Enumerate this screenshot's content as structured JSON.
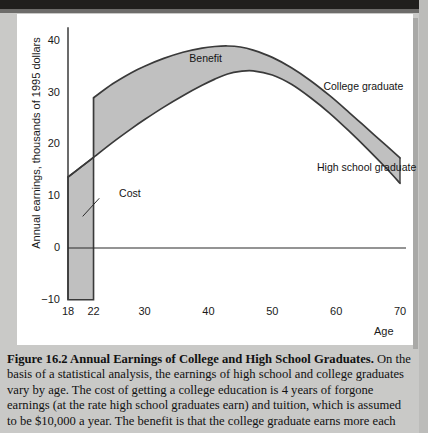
{
  "figure": {
    "caption_bold": "Figure 16.2  Annual Earnings of College and High School Graduates.",
    "caption_body": "  On the basis of a statistical analysis, the earnings of high school and college graduates vary by age. The cost of getting a college education is 4 years of forgone earnings (at the rate high school graduates earn) and tuition, which is assumed to be $10,000 a year. The benefit is that the college graduate earns more each"
  },
  "chart_data": {
    "type": "area",
    "title": "Annual Earnings of College and High School Graduates",
    "xlabel": "Age",
    "ylabel": "Annual earnings, thousands of 1995 dollars",
    "xlim": [
      18,
      70
    ],
    "ylim": [
      -10,
      43
    ],
    "xticks": [
      18,
      22,
      30,
      40,
      50,
      60,
      70
    ],
    "xtick_labels": [
      "18",
      "22",
      "30",
      "40",
      "50",
      "60",
      "70"
    ],
    "yticks": [
      -10,
      0,
      10,
      20,
      30,
      40
    ],
    "ytick_labels": [
      "-10",
      "0",
      "10",
      "20",
      "30",
      "40"
    ],
    "grid": false,
    "zero_line": 0,
    "annotations": [
      {
        "text": "Benefit",
        "x": 37,
        "y": 36.5
      },
      {
        "text": "Cost",
        "x": 26,
        "y": 10.5
      },
      {
        "text": "College graduate",
        "x": 58,
        "y": 31
      },
      {
        "text": "High school graduate",
        "x": 57,
        "y": 15.5
      }
    ],
    "series": [
      {
        "name": "High school graduate",
        "x": [
          18,
          20,
          22,
          25,
          28,
          30,
          33,
          36,
          39,
          41,
          43,
          45,
          47,
          50,
          53,
          56,
          59,
          62,
          65,
          68,
          70
        ],
        "values": [
          13.7,
          15.6,
          17.5,
          20.4,
          23.1,
          24.8,
          27.2,
          29.4,
          31.4,
          32.6,
          33.6,
          34.1,
          34.2,
          33.4,
          31.6,
          29.0,
          26.0,
          22.6,
          19.0,
          15.2,
          12.5
        ]
      },
      {
        "name": "College graduate",
        "x": [
          22,
          25,
          28,
          30,
          33,
          36,
          39,
          41,
          43,
          45,
          47,
          50,
          53,
          56,
          59,
          62,
          65,
          68,
          70
        ],
        "values": [
          29.0,
          31.7,
          33.9,
          35.1,
          36.6,
          37.8,
          38.6,
          38.9,
          39.0,
          38.8,
          38.2,
          36.8,
          34.8,
          32.3,
          29.4,
          26.2,
          22.9,
          19.6,
          17.4
        ]
      },
      {
        "name": "Cost (forgone earnings and tuition)",
        "x": [
          18,
          22
        ],
        "lower": [
          -10,
          -10
        ],
        "upper": [
          13.7,
          17.5
        ]
      }
    ],
    "colors": {
      "band_fill": "#c0c0c0",
      "curve": "#3a3a3a",
      "axis": "#3a3a3a",
      "background": "#ffffff"
    }
  }
}
